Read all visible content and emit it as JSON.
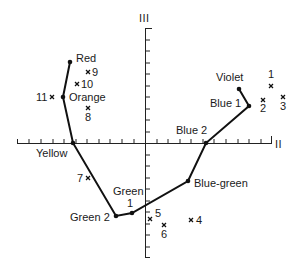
{
  "axes": {
    "horizontal_label": "II",
    "vertical_label": "III"
  },
  "color_path": {
    "points": [
      {
        "name": "Red",
        "label": "Red",
        "x": 70,
        "y": 62
      },
      {
        "name": "Orange",
        "label": "Orange",
        "x": 63,
        "y": 97
      },
      {
        "name": "Yellow",
        "label": "Yellow",
        "x": 73,
        "y": 143
      },
      {
        "name": "Green 2",
        "label": "Green 2",
        "x": 116,
        "y": 216
      },
      {
        "name": "Green 1",
        "label": "1",
        "x": 132,
        "y": 213
      },
      {
        "name": "Blue-green",
        "label": "Blue-green",
        "x": 188,
        "y": 181
      },
      {
        "name": "Blue 2",
        "label": "Blue 2",
        "x": 206,
        "y": 143
      },
      {
        "name": "Blue 1",
        "label": "Blue 1",
        "x": 249,
        "y": 106
      },
      {
        "name": "Violet",
        "label": "Violet",
        "x": 239,
        "y": 89
      }
    ],
    "green_label": "Green"
  },
  "crosses": [
    {
      "label": "1",
      "x": 271,
      "y": 86
    },
    {
      "label": "2",
      "x": 263,
      "y": 100
    },
    {
      "label": "3",
      "x": 283,
      "y": 97
    },
    {
      "label": "4",
      "x": 191,
      "y": 220
    },
    {
      "label": "5",
      "x": 150,
      "y": 219
    },
    {
      "label": "6",
      "x": 164,
      "y": 225
    },
    {
      "label": "7",
      "x": 88,
      "y": 178
    },
    {
      "label": "8",
      "x": 88,
      "y": 108
    },
    {
      "label": "9",
      "x": 88,
      "y": 72
    },
    {
      "label": "10",
      "x": 77,
      "y": 84
    },
    {
      "label": "11",
      "x": 52,
      "y": 97
    }
  ]
}
